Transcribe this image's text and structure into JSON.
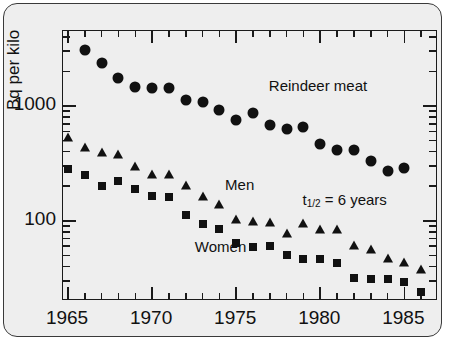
{
  "chart_data": {
    "type": "scatter",
    "title": "",
    "xlabel": "",
    "ylabel": "Bq per kilo",
    "xlim": [
      1964.7,
      1987.0
    ],
    "ylim": [
      20,
      4500
    ],
    "yscale": "log",
    "grid": false,
    "legend": "inline-annotations",
    "x_ticks": [
      1965,
      1970,
      1975,
      1980,
      1985
    ],
    "x_tick_labels": [
      "1965",
      "1970",
      "1975",
      "1980",
      "1985"
    ],
    "x_minor_ticks": [
      1966,
      1967,
      1968,
      1969,
      1971,
      1972,
      1973,
      1974,
      1976,
      1977,
      1978,
      1979,
      1981,
      1982,
      1983,
      1984,
      1986
    ],
    "y_ticks": [
      100,
      1000
    ],
    "y_tick_labels": [
      "100",
      "1000"
    ],
    "y_minor_ticks": [
      30,
      40,
      50,
      60,
      70,
      80,
      90,
      200,
      300,
      400,
      500,
      600,
      700,
      800,
      900,
      2000,
      3000,
      4000
    ],
    "annotations": [
      {
        "text": "Reindeer meat",
        "x": 1977.0,
        "y": 1450
      },
      {
        "text": "Men",
        "x": 1974.4,
        "y": 200
      },
      {
        "text": "Women",
        "x": 1972.6,
        "y": 58
      },
      {
        "text": "t1/2 = 6 years",
        "text_main": "t",
        "text_sub": "1/2",
        "text_rest": " = 6 years",
        "x": 1979.0,
        "y": 150
      }
    ],
    "series": [
      {
        "name": "Reindeer meat",
        "marker": "circle",
        "color": "#111111",
        "x": [
          1966,
          1967,
          1968,
          1969,
          1970,
          1971,
          1972,
          1973,
          1974,
          1975,
          1976,
          1977,
          1978,
          1979,
          1980,
          1981,
          1982,
          1983,
          1984,
          1985
        ],
        "y": [
          3100,
          2350,
          1750,
          1450,
          1440,
          1440,
          1130,
          1080,
          930,
          760,
          860,
          680,
          630,
          660,
          470,
          410,
          410,
          330,
          270,
          290
        ]
      },
      {
        "name": "Men",
        "marker": "triangle",
        "color": "#111111",
        "x": [
          1965,
          1966,
          1967,
          1968,
          1969,
          1970,
          1971,
          1972,
          1973,
          1974,
          1975,
          1976,
          1977,
          1978,
          1979,
          1980,
          1981,
          1982,
          1983,
          1984,
          1985,
          1986
        ],
        "y": [
          540,
          440,
          400,
          380,
          300,
          255,
          255,
          205,
          165,
          140,
          103,
          100,
          97,
          78,
          95,
          85,
          85,
          62,
          57,
          47,
          44,
          38
        ]
      },
      {
        "name": "Women",
        "marker": "square",
        "color": "#111111",
        "x": [
          1965,
          1966,
          1967,
          1968,
          1969,
          1970,
          1971,
          1972,
          1973,
          1974,
          1975,
          1976,
          1977,
          1978,
          1979,
          1980,
          1981,
          1982,
          1983,
          1984,
          1985,
          1986
        ],
        "y": [
          280,
          250,
          200,
          220,
          190,
          165,
          160,
          112,
          93,
          85,
          64,
          59,
          60,
          50,
          46,
          46,
          43,
          32,
          31,
          31,
          29,
          24
        ]
      }
    ]
  }
}
